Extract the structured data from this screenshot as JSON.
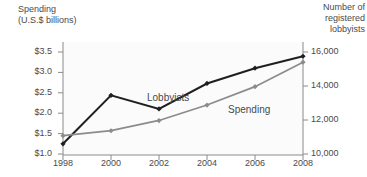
{
  "chart_data": {
    "type": "line",
    "title": "",
    "xlabel": "",
    "categories": [
      "1998",
      "2000",
      "2002",
      "2004",
      "2006",
      "2008"
    ],
    "x": [
      1998,
      2000,
      2002,
      2004,
      2006,
      2008
    ],
    "grid": false,
    "legend_position": "inline-labels",
    "axes": {
      "left": {
        "label": "Spending\n(U.S.$ billions)",
        "label_line1": "Spending",
        "label_line2": "(U.S.$ billions)",
        "ticks": [
          "$1.0",
          "$1.5",
          "$2.0",
          "$2.5",
          "$3.0",
          "$3.5"
        ],
        "tick_values": [
          1.0,
          1.5,
          2.0,
          2.5,
          3.0,
          3.5
        ],
        "ylim": [
          1.0,
          3.5
        ]
      },
      "right": {
        "label": "Number of\nregistered\nlobbyists",
        "label_line1": "Number of",
        "label_line2": "registered",
        "label_line3": "lobbyists",
        "ticks": [
          "10,000",
          "12,000",
          "14,000",
          "16,000"
        ],
        "tick_values": [
          10000,
          12000,
          14000,
          16000
        ],
        "ylim": [
          10000,
          16600
        ]
      }
    },
    "series": [
      {
        "name": "Lobbyists",
        "axis": "right",
        "color": "#1f1f1f",
        "marker": "diamond",
        "values": [
          10600,
          13450,
          12650,
          14150,
          15050,
          15750
        ]
      },
      {
        "name": "Spending",
        "axis": "left",
        "color": "#8c8c8c",
        "marker": "diamond",
        "values": [
          1.45,
          1.57,
          1.82,
          2.2,
          2.65,
          3.25
        ]
      }
    ],
    "annotations": [
      {
        "text": "Lobbyists",
        "x_px": 147,
        "y_px": 92
      },
      {
        "text": "Spending",
        "x_px": 228,
        "y_px": 104
      }
    ]
  },
  "colors": {
    "lobbyists_line": "#1f1f1f",
    "spending_line": "#8c8c8c",
    "axis": "#8a8a8a",
    "text": "#4a4a4a",
    "plot_background": "#fbfbfb"
  }
}
